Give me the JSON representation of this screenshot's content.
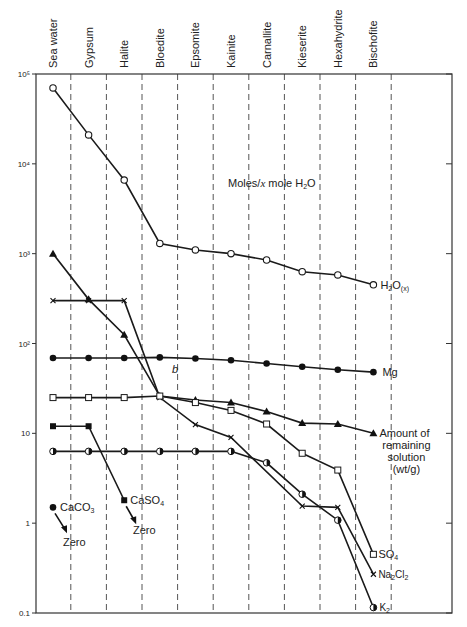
{
  "chart_data": {
    "type": "line",
    "title": "",
    "annotation_title": "Moles/x mole H2O",
    "xlabel": "",
    "ylabel": "",
    "yscale": "log",
    "ylim": [
      0.1,
      100000
    ],
    "y_ticks": [
      {
        "value": 100000,
        "label": "10⁵"
      },
      {
        "value": 10000,
        "label": "10⁴"
      },
      {
        "value": 1000,
        "label": "10³"
      },
      {
        "value": 100,
        "label": "10²"
      },
      {
        "value": 10,
        "label": "10"
      },
      {
        "value": 1,
        "label": "1"
      },
      {
        "value": 0.1,
        "label": "0.1"
      }
    ],
    "categories": [
      "Sea water",
      "Gypsum",
      "Halite",
      "Bloedite",
      "Epsomite",
      "Kainite",
      "Carnallite",
      "Kieserite",
      "Hexahydrite",
      "Bischofite"
    ],
    "grid": "vertical dashed separators between categories",
    "series": [
      {
        "name": "H2O(x)",
        "label": "H₂O",
        "label_sub": "(x)",
        "marker": "open-circle",
        "values": [
          70000,
          21000,
          6600,
          1300,
          1100,
          1000,
          850,
          630,
          580,
          450
        ]
      },
      {
        "name": "Amount of remaining solution (wt/g)",
        "label_lines": [
          "Amount of",
          "remaining",
          "solution",
          "(wt/g)"
        ],
        "marker": "filled-triangle",
        "values": [
          1000,
          310,
          125,
          26,
          23.5,
          22,
          17.5,
          13,
          12.7,
          10
        ]
      },
      {
        "name": "Na2Cl2",
        "label": "Na₂Cl₂",
        "marker": "cross",
        "values": [
          300,
          300,
          300,
          25,
          12.5,
          9,
          null,
          1.55,
          1.5,
          0.27
        ]
      },
      {
        "name": "Mg",
        "label": "Mg",
        "marker": "filled-circle",
        "values": [
          69,
          69,
          69,
          70,
          68,
          65,
          60,
          55,
          51,
          48
        ]
      },
      {
        "name": "SO4",
        "label": "SO₄",
        "marker": "open-square",
        "values": [
          25,
          25,
          25,
          26,
          22,
          18,
          12.7,
          6,
          3.9,
          0.45
        ]
      },
      {
        "name": "CaSO4",
        "label": "CaSO₄",
        "marker": "filled-square",
        "values": [
          12,
          12,
          1.8,
          null,
          null,
          null,
          null,
          null,
          null,
          null
        ],
        "end_note": "Zero"
      },
      {
        "name": "K2",
        "label": "K₂",
        "marker": "half-circle",
        "values": [
          6.3,
          6.3,
          6.3,
          6.3,
          6.3,
          6.3,
          4.7,
          2.1,
          1.08,
          0.115
        ]
      },
      {
        "name": "CaCO3",
        "label": "CaCO₃",
        "marker": "filled-circle",
        "values": [
          1.5,
          null,
          null,
          null,
          null,
          null,
          null,
          null,
          null,
          null
        ],
        "end_note": "Zero"
      }
    ],
    "annotations": [
      {
        "text": "b",
        "near": "Bloedite/Epsomite, below Mg line"
      },
      {
        "text": "Zero",
        "near": "CaCO3 arrow"
      },
      {
        "text": "Zero",
        "near": "CaSO4 arrow"
      }
    ],
    "legend": "inline labels at right end of each series"
  }
}
